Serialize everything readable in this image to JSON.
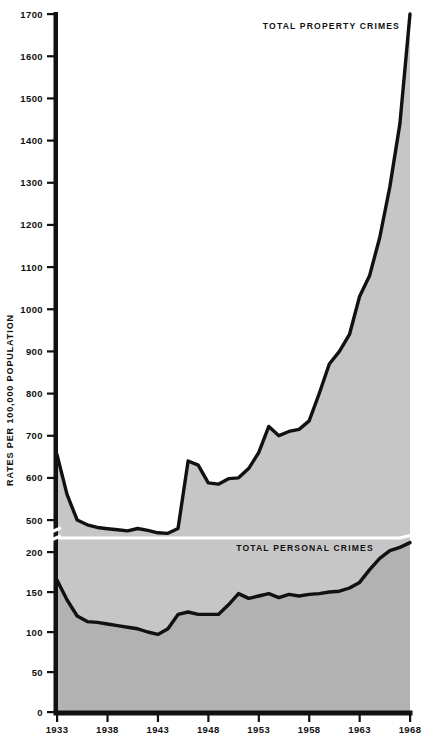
{
  "chart_data": {
    "type": "area",
    "title": "",
    "subtitle": "",
    "xlabel": "",
    "ylabel": "RATES PER 100,000 POPULATION",
    "x_tick_labels": [
      "1933",
      "1938",
      "1943",
      "1948",
      "1953",
      "1958",
      "1963",
      "1968"
    ],
    "x_ticks": [
      1933,
      1938,
      1943,
      1948,
      1953,
      1958,
      1963,
      1968
    ],
    "xlim": [
      1933,
      1968
    ],
    "y_tick_labels": [
      "0",
      "50",
      "100",
      "150",
      "200",
      "500",
      "600",
      "700",
      "800",
      "900",
      "1000",
      "1100",
      "1200",
      "1300",
      "1400",
      "1500",
      "1600",
      "1700"
    ],
    "y_ticks_lower": [
      0,
      50,
      100,
      150,
      200
    ],
    "y_ticks_upper": [
      500,
      600,
      700,
      800,
      900,
      1000,
      1100,
      1200,
      1300,
      1400,
      1500,
      1600,
      1700
    ],
    "ylim_lower": [
      0,
      200
    ],
    "ylim_upper": [
      470,
      1700
    ],
    "axis_break": true,
    "axis_break_note": "scale break between 200 and 500",
    "grid": false,
    "legend_position": "inline-annotations",
    "annotations": [
      {
        "text": "TOTAL PROPERTY CRIMES",
        "x": 1962,
        "y": 1690
      },
      {
        "text": "TOTAL PERSONAL CRIMES",
        "x": 1952,
        "y": 240
      }
    ],
    "colors": {
      "property_fill": "#c6c6c6",
      "personal_fill": "#b2b2b2",
      "line": "#111111",
      "white_line": "#ffffff",
      "axis": "#111111",
      "background": "#ffffff"
    },
    "x": [
      1933,
      1934,
      1935,
      1936,
      1937,
      1938,
      1939,
      1940,
      1941,
      1942,
      1943,
      1944,
      1945,
      1946,
      1947,
      1948,
      1949,
      1950,
      1951,
      1952,
      1953,
      1954,
      1955,
      1956,
      1957,
      1958,
      1959,
      1960,
      1961,
      1962,
      1963,
      1964,
      1965,
      1966,
      1967,
      1968
    ],
    "series": [
      {
        "name": "TOTAL PROPERTY CRIMES",
        "key": "property",
        "fill": "#c6c6c6",
        "values": [
          655,
          560,
          500,
          455,
          430,
          418,
          408,
          398,
          420,
          402,
          380,
          375,
          420,
          640,
          630,
          588,
          585,
          598,
          600,
          622,
          660,
          722,
          700,
          710,
          715,
          735,
          800,
          870,
          900,
          940,
          1030,
          1080,
          1170,
          1290,
          1440,
          1700
        ]
      },
      {
        "name": "TOTAL PERSONAL CRIMES",
        "key": "personal",
        "fill": "#b2b2b2",
        "values": [
          165,
          140,
          120,
          113,
          112,
          110,
          108,
          106,
          104,
          100,
          97,
          104,
          122,
          125,
          122,
          122,
          122,
          134,
          148,
          142,
          145,
          148,
          143,
          147,
          145,
          147,
          148,
          150,
          151,
          155,
          162,
          178,
          192,
          212,
          243,
          288
        ]
      }
    ]
  }
}
